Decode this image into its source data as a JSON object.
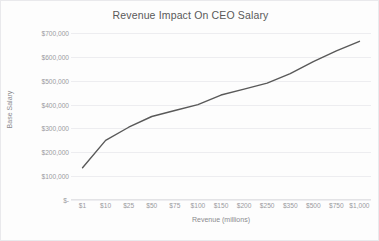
{
  "chart_data": {
    "type": "line",
    "title": "Revenue Impact On CEO Salary",
    "xlabel": "Revenue (millions)",
    "ylabel": "Base Salary",
    "categories": [
      "$1",
      "$10",
      "$25",
      "$50",
      "$75",
      "$100",
      "$150",
      "$200",
      "$250",
      "$350",
      "$500",
      "$750",
      "$1,000"
    ],
    "values": [
      135000,
      250000,
      305000,
      350000,
      375000,
      400000,
      440000,
      465000,
      490000,
      530000,
      580000,
      625000,
      665000
    ],
    "series": [
      {
        "name": "Base Salary",
        "values": [
          135000,
          250000,
          305000,
          350000,
          375000,
          400000,
          440000,
          465000,
          490000,
          530000,
          580000,
          625000,
          665000
        ]
      }
    ],
    "ylim": [
      0,
      700000
    ],
    "ytick_values": [
      700000,
      600000,
      500000,
      400000,
      300000,
      200000,
      100000,
      0
    ],
    "ytick_labels": [
      "$700,000",
      "$600,000",
      "$500,000",
      "$400,000",
      "$300,000",
      "$200,000",
      "$100,000",
      "$-"
    ],
    "grid": true,
    "gridlines": "horizontal",
    "legend": "none",
    "line_color": "#595959",
    "line_width": 1.4,
    "markers": false,
    "background_color": "#fdfdfd",
    "gridline_color": "#ededf0",
    "text_color": "#9a9a9e",
    "title_color": "#595959"
  }
}
